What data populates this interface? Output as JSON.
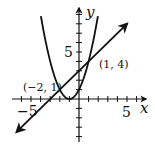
{
  "chart_data": {
    "type": "line",
    "title": "",
    "xlabel": "x",
    "ylabel": "y",
    "xlim": [
      -6,
      7
    ],
    "ylim": [
      -5,
      9
    ],
    "grid": false,
    "x_tick_labels": [
      {
        "value": -5,
        "label": "−5"
      },
      {
        "value": 5,
        "label": "5"
      }
    ],
    "y_tick_labels": [
      {
        "value": 5,
        "label": "5"
      }
    ],
    "series": [
      {
        "name": "parabola",
        "equation": "y = (x + 1)^2",
        "x_range": [
          -3.97,
          1.97
        ]
      },
      {
        "name": "line",
        "equation": "y = x + 3",
        "x_range": [
          -6.5,
          5.0
        ],
        "arrows": "both"
      }
    ],
    "annotations": [
      {
        "text": "(−2, 1)",
        "x": -2,
        "y": 1
      },
      {
        "text": "(1, 4)",
        "x": 1,
        "y": 4
      }
    ]
  },
  "labels": {
    "x_axis": "x",
    "y_axis": "y",
    "x_neg5": "−5",
    "x_pos5": "5",
    "y_pos5": "5",
    "point_a": "(−2, 1)",
    "point_b": "(1, 4)"
  },
  "colors": {
    "ink": "#111111",
    "background": "#ffffff"
  }
}
